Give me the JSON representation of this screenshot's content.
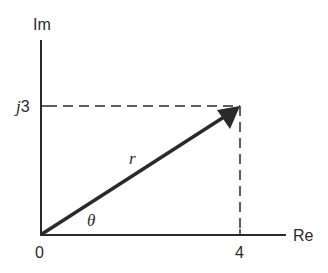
{
  "diagram": {
    "axes": {
      "imaginary_label": "Im",
      "real_label": "Re",
      "origin_label": "0",
      "imag_tick_label_prefix": "j",
      "imag_tick_label_value": "3",
      "real_tick_label": "4"
    },
    "vector": {
      "magnitude_label": "r",
      "angle_label": "θ",
      "real": 4,
      "imag": 3
    },
    "colors": {
      "ink": "#2a2a2a",
      "background": "#ffffff"
    }
  }
}
